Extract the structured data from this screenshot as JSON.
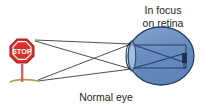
{
  "figure": {
    "title_top_line1": "In focus",
    "title_top_line2": "on retina",
    "caption_bottom": "Normal eye",
    "object_label": "STOP",
    "background_color": "#ffffff",
    "text_color": "#231f20"
  },
  "colors": {
    "eye_fill": "#6b8fc0",
    "eye_fill_light": "#8aa8d0",
    "eye_outline": "#24406b",
    "lens_outline": "#2b4a72",
    "ray_line": "#2f2f2f",
    "inner_ray_line": "#24406b",
    "sign_red": "#d8312b",
    "sign_red_dark": "#a61f1a",
    "sign_white": "#ffffff",
    "pole_color": "#e0605c",
    "ground_color": "#b89a4a",
    "retina_image": "#1b2f52"
  },
  "object": {
    "name": "stop-sign",
    "center_x": 22,
    "center_y": 52,
    "radius": 14,
    "pole_top_y": 66,
    "pole_bottom_y": 82
  },
  "eye": {
    "center_x": 161,
    "center_y": 56,
    "radius_x": 33,
    "radius_y": 29,
    "cornea_x": 129,
    "lens_top_y": 43,
    "lens_bottom_y": 70,
    "retina_x": 186,
    "retina_image_y": 58
  },
  "rays": {
    "source_top": {
      "x": 35,
      "y": 40
    },
    "source_bottom": {
      "x": 38,
      "y": 80
    },
    "lens_entry_top": {
      "x": 131,
      "y": 44
    },
    "lens_entry_bottom": {
      "x": 131,
      "y": 69
    },
    "focus_top": {
      "x": 185,
      "y": 53
    },
    "focus_bottom": {
      "x": 185,
      "y": 63
    },
    "count": 4
  }
}
